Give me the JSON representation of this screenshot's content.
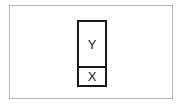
{
  "diagram": {
    "stack": {
      "top_label": "Y",
      "bottom_label": "X"
    }
  }
}
